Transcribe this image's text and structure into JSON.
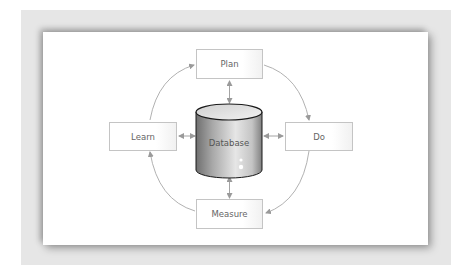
{
  "diagram": {
    "type": "cycle",
    "center": {
      "label": "Database",
      "shape": "cylinder"
    },
    "nodes": [
      {
        "id": "plan",
        "label": "Plan"
      },
      {
        "id": "do",
        "label": "Do"
      },
      {
        "id": "measure",
        "label": "Measure"
      },
      {
        "id": "learn",
        "label": "Learn"
      }
    ],
    "edges": [
      {
        "from": "plan",
        "to": "do",
        "style": "curved-arrow"
      },
      {
        "from": "do",
        "to": "measure",
        "style": "curved-arrow"
      },
      {
        "from": "measure",
        "to": "learn",
        "style": "curved-arrow"
      },
      {
        "from": "learn",
        "to": "plan",
        "style": "curved-arrow"
      },
      {
        "from": "plan",
        "to": "database",
        "style": "bidirectional"
      },
      {
        "from": "do",
        "to": "database",
        "style": "bidirectional"
      },
      {
        "from": "measure",
        "to": "database",
        "style": "bidirectional"
      },
      {
        "from": "learn",
        "to": "database",
        "style": "bidirectional"
      }
    ],
    "colors": {
      "frame": "#e6e6e6",
      "panel": "#ffffff",
      "box_border": "#c4c4c4",
      "text": "#666666",
      "arrow": "#9a9a9a",
      "cylinder_dark": "#7a7a7a",
      "cylinder_light": "#e8e8e8"
    }
  }
}
